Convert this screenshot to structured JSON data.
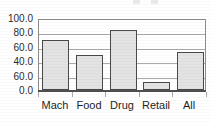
{
  "chart_data": {
    "type": "bar",
    "title": "",
    "xlabel": "",
    "ylabel": "",
    "categories": [
      "Mach",
      "Food",
      "Drug",
      "Retail",
      "All"
    ],
    "values": [
      69,
      48.5,
      83,
      10.5,
      52.5
    ],
    "ylim": [
      0,
      100
    ],
    "ytick_values": [
      100,
      80,
      60,
      40,
      20,
      0
    ],
    "ytick_labels": [
      "100.0",
      "80.0",
      "60.0",
      "40.0",
      "60.0",
      "0.0"
    ],
    "grid": true,
    "legend": false,
    "legend_position": "none",
    "note_on_ticks": "The fifth y tick is printed as 60.0 in the source image where 20.0 would be expected; labels transcribed exactly as rendered."
  },
  "axes": {
    "y_ticks": [
      {
        "label": "100.0",
        "value": 100
      },
      {
        "label": "80.0",
        "value": 80
      },
      {
        "label": "60.0",
        "value": 60
      },
      {
        "label": "40.0",
        "value": 40
      },
      {
        "label": "60.0",
        "value": 20
      },
      {
        "label": "0.0",
        "value": 0
      }
    ],
    "x_ticks": [
      {
        "label": "Mach"
      },
      {
        "label": "Food"
      },
      {
        "label": "Drug"
      },
      {
        "label": "Retail"
      },
      {
        "label": "All"
      }
    ]
  },
  "style": {
    "bar_fill": "#e3e3e3",
    "bar_border": "#4a4a4a",
    "gridline_color": "#a9a9a9",
    "axis_color": "#4f4f4f",
    "plot_border": "#8c8c8c",
    "text_color": "#1f1f1f",
    "background": "#ffffff"
  }
}
